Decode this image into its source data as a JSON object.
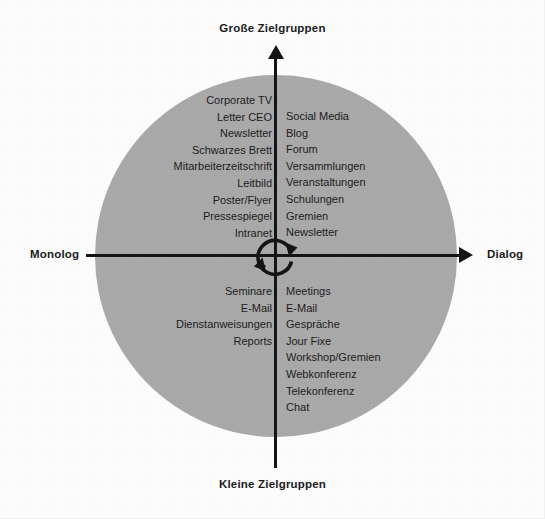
{
  "diagram": {
    "type": "two-axis-quadrant-matrix",
    "axes": {
      "x_left_label": "Monolog",
      "x_right_label": "Dialog",
      "y_top_label": "Große Zielgruppen",
      "y_bottom_label": "Kleine Zielgruppen"
    },
    "center_icon": "cycle-arrow-icon",
    "colors": {
      "disc": "#a9a9a9",
      "axis": "#151515",
      "text": "#1c1c1c",
      "background": "#fcfcfc"
    },
    "quadrants": {
      "top_left": {
        "name": "Monolog / Große Zielgruppen",
        "items": [
          "Corporate TV",
          "Letter CEO",
          "Newsletter",
          "Schwarzes Brett",
          "Mitarbeiterzeitschrift",
          "Leitbild",
          "Poster/Flyer",
          "Pressespiegel",
          "Intranet"
        ]
      },
      "top_right": {
        "name": "Dialog / Große Zielgruppen",
        "items": [
          "Social Media",
          "Blog",
          "Forum",
          "Versammlungen",
          "Veranstaltungen",
          "Schulungen",
          "Gremien",
          "Newsletter"
        ]
      },
      "bottom_left": {
        "name": "Monolog / Kleine Zielgruppen",
        "items": [
          "Seminare",
          "E-Mail",
          "Dienstanweisungen",
          "Reports"
        ]
      },
      "bottom_right": {
        "name": "Dialog / Kleine Zielgruppen",
        "items": [
          "Meetings",
          "E-Mail",
          "Gespräche",
          "Jour Fixe",
          "Workshop/Gremien",
          "Webkonferenz",
          "Telekonferenz",
          "Chat"
        ]
      }
    }
  }
}
